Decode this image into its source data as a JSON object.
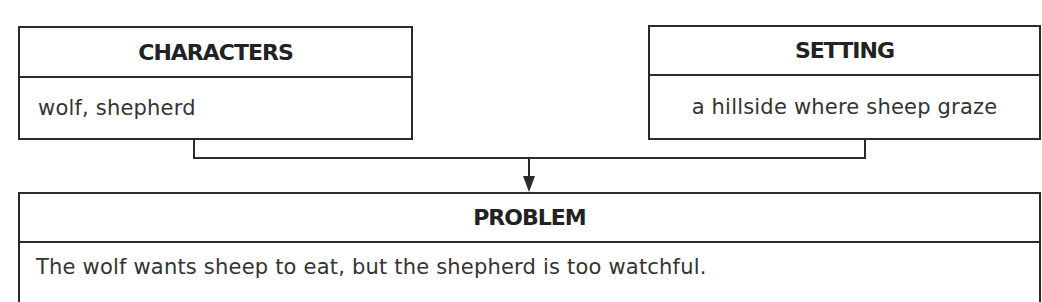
{
  "diagram": {
    "type": "story-map",
    "characters": {
      "title": "CHARACTERS",
      "content": "wolf, shepherd"
    },
    "setting": {
      "title": "SETTING",
      "content": "a hillside where sheep graze"
    },
    "problem": {
      "title": "PROBLEM",
      "content": "The wolf wants sheep to eat, but the shepherd is too watchful."
    },
    "connectors": [
      {
        "from": "characters",
        "to": "problem",
        "icon": "arrow-down-icon"
      },
      {
        "from": "setting",
        "to": "problem",
        "icon": "arrow-down-icon"
      }
    ],
    "colors": {
      "line": "#2b2b2b",
      "header_text": "#222222",
      "body_text": "#333333",
      "background": "#ffffff"
    }
  }
}
